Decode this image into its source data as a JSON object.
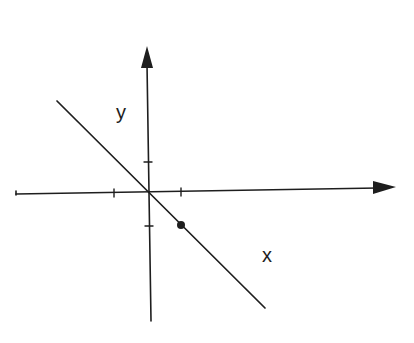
{
  "diagram": {
    "title": "",
    "background": "#ffffff",
    "ink_color": "#1e1e1e",
    "labels": {
      "y_axis": "y",
      "x_axis": "x"
    },
    "axes": {
      "origin_px": [
        149,
        192
      ],
      "x_axis": {
        "start_px": [
          16,
          194
        ],
        "arrow_tip_px": [
          396,
          187
        ]
      },
      "y_axis": {
        "start_px": [
          151,
          321
        ],
        "arrow_tip_px": [
          147,
          46
        ]
      }
    },
    "ticks": {
      "x": [
        {
          "value": -1,
          "px": [
            114,
            193
          ]
        },
        {
          "value": 1,
          "px": [
            181,
            192
          ]
        }
      ],
      "y": [
        {
          "value": 1,
          "px": [
            148,
            162
          ]
        },
        {
          "value": -1,
          "px": [
            149,
            226
          ]
        }
      ]
    },
    "line": {
      "description": "line through origin with slope -1",
      "equation": "y = -x",
      "start_px": [
        57,
        101
      ],
      "end_px": [
        265,
        308
      ]
    },
    "points": [
      {
        "label": "(1, -1)",
        "coords": [
          1,
          -1
        ],
        "px": [
          181,
          225
        ]
      }
    ]
  }
}
